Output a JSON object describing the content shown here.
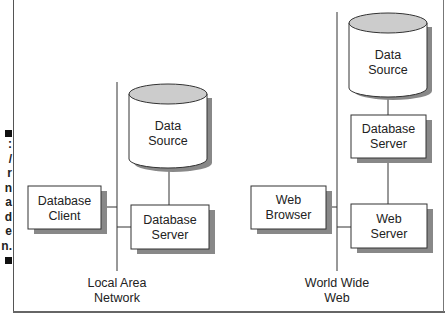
{
  "caption": {
    "chars": [
      ":",
      "/",
      "r",
      "n",
      "a",
      "d",
      "e",
      "n."
    ]
  },
  "left_network": {
    "data_source": {
      "line1": "Data",
      "line2": "Source"
    },
    "client": {
      "line1": "Database",
      "line2": "Client"
    },
    "server": {
      "line1": "Database",
      "line2": "Server"
    },
    "network_label": {
      "line1": "Local Area",
      "line2": "Network"
    }
  },
  "right_network": {
    "data_source": {
      "line1": "Data",
      "line2": "Source"
    },
    "db_server": {
      "line1": "Database",
      "line2": "Server"
    },
    "browser": {
      "line1": "Web",
      "line2": "Browser"
    },
    "web_server": {
      "line1": "Web",
      "line2": "Server"
    },
    "network_label": {
      "line1": "World Wide",
      "line2": "Web"
    }
  },
  "colors": {
    "cylinder_top": "#cccccc",
    "line": "#333333",
    "shadow": "#888888"
  }
}
